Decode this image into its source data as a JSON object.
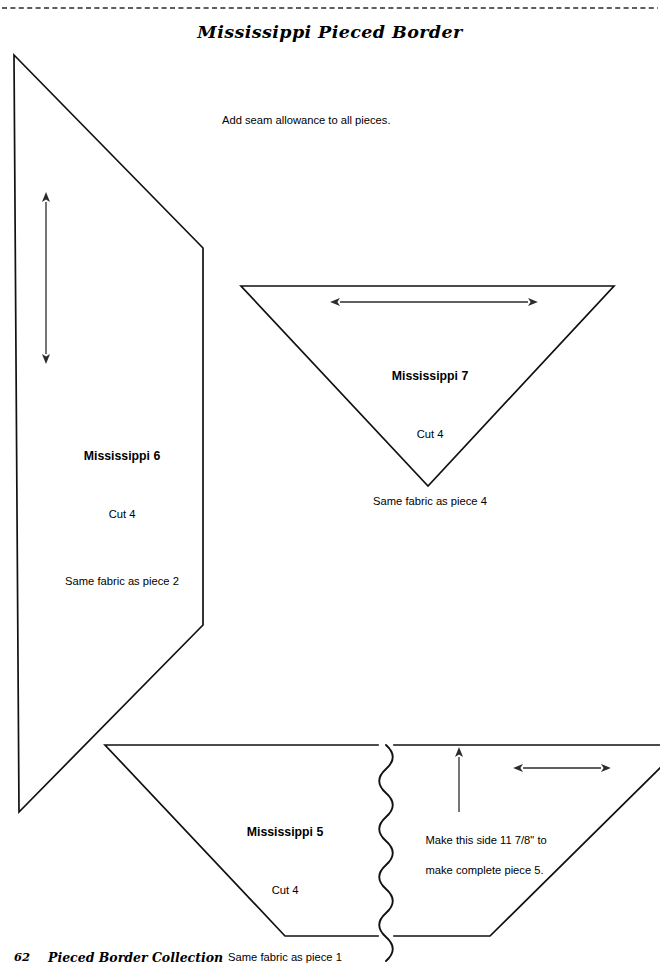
{
  "page": {
    "title": "Mississippi Pieced Border",
    "instruction_note": "Add seam allowance to all pieces.",
    "background_color": "#ffffff",
    "ink_color": "#111111"
  },
  "cut_line": {
    "name": "dashed-cut-line",
    "style": "dashed",
    "y": 8
  },
  "pieces": [
    {
      "id": "mississippi-6",
      "name": "Mississippi 6",
      "cut": "Cut 4",
      "fabric_note": "Same fabric as piece 2",
      "shape": "parallelogram",
      "grain_arrow": "vertical-double-headed"
    },
    {
      "id": "mississippi-7",
      "name": "Mississippi 7",
      "cut": "Cut 4",
      "fabric_note": "Same fabric as piece 4",
      "shape": "inverted-triangle",
      "grain_arrow": "horizontal-double-headed"
    },
    {
      "id": "mississippi-5",
      "name": "Mississippi 5",
      "cut": "Cut 4",
      "fabric_note": "Same fabric as piece 1",
      "shape": "trapezoid-with-break",
      "grain_arrow": "horizontal-double-headed"
    }
  ],
  "callout": {
    "line1": "Make this side 11 7/8\" to",
    "line2": "make complete piece 5."
  },
  "footer": {
    "page_number": "62",
    "book_title": "Pieced Border Collection"
  }
}
